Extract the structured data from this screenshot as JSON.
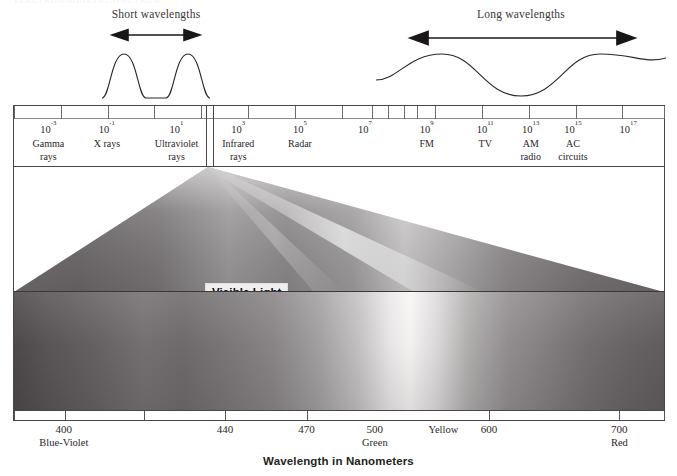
{
  "top_caption": "ELECTROMAGNETIC SPECTRUM",
  "waves": {
    "short": {
      "label": "Short wavelengths"
    },
    "long": {
      "label": "Long wavelengths"
    }
  },
  "scale": {
    "ticks_pct": [
      0,
      7.2,
      14.4,
      21.6,
      28.8,
      36.0,
      43.2,
      50.4,
      55.0,
      57.6,
      60.0,
      62.0,
      64.8,
      72.0,
      79.2,
      86.4,
      93.6,
      100
    ],
    "visible_slot": {
      "start_pct": 29.6,
      "end_pct": 30.6
    },
    "labels": [
      {
        "pos_pct": 5.3,
        "exponent": "-3",
        "name": [
          "Gamma",
          "rays"
        ]
      },
      {
        "pos_pct": 14.3,
        "exponent": "-1",
        "name": [
          "X rays"
        ]
      },
      {
        "pos_pct": 25.0,
        "exponent": "1",
        "name": [
          "Ultraviolet",
          "rays"
        ]
      },
      {
        "pos_pct": 34.5,
        "exponent": "3",
        "name": [
          "Infrared",
          "rays"
        ]
      },
      {
        "pos_pct": 44.0,
        "exponent": "5",
        "name": [
          "Radar"
        ]
      },
      {
        "pos_pct": 54.0,
        "exponent": "7",
        "name": []
      },
      {
        "pos_pct": 63.5,
        "exponent": "9",
        "name": [
          "FM"
        ]
      },
      {
        "pos_pct": 72.5,
        "exponent": "11",
        "name": [
          "TV"
        ]
      },
      {
        "pos_pct": 79.5,
        "exponent": "13",
        "name": [
          "AM",
          "radio"
        ]
      },
      {
        "pos_pct": 86.0,
        "exponent": "15",
        "name": [
          "AC",
          "circuits"
        ]
      },
      {
        "pos_pct": 94.5,
        "exponent": "17",
        "name": []
      }
    ]
  },
  "visible_light_label": "Visible Light",
  "nm_ruler": {
    "ticks_pct": [
      0,
      7.8,
      20.0,
      32.5,
      45.0,
      73.0,
      93.0,
      100
    ],
    "labels": [
      {
        "pos_pct": 7.8,
        "value": "400",
        "color_name": "Blue-Violet"
      },
      {
        "pos_pct": 32.5,
        "value": "440",
        "color_name": ""
      },
      {
        "pos_pct": 45.0,
        "value": "470",
        "color_name": ""
      },
      {
        "pos_pct": 55.5,
        "value": "500",
        "color_name": "Green"
      },
      {
        "pos_pct": 66.0,
        "value": "",
        "color_name": "Yellow"
      },
      {
        "pos_pct": 73.0,
        "value": "600",
        "color_name": ""
      },
      {
        "pos_pct": 93.0,
        "value": "700",
        "color_name": "Red"
      }
    ]
  },
  "axis_title": "Wavelength in Nanometers",
  "chart_data": {
    "type": "heatmap",
    "title": "Wavelength in Nanometers",
    "xlabel": "Wavelength in Nanometers",
    "ylabel": "",
    "grid": false,
    "legend_position": "none",
    "em_spectrum_scale_unit": "nanometers",
    "em_bands": [
      {
        "name": "Gamma rays",
        "wavelength_nm_label": "10^-3"
      },
      {
        "name": "X rays",
        "wavelength_nm_label": "10^-1"
      },
      {
        "name": "Ultraviolet rays",
        "wavelength_nm_label": "10^1"
      },
      {
        "name": "Visible Light",
        "wavelength_nm_label": "400-700"
      },
      {
        "name": "Infrared rays",
        "wavelength_nm_label": "10^3"
      },
      {
        "name": "Radar",
        "wavelength_nm_label": "10^5"
      },
      {
        "name": "FM",
        "wavelength_nm_label": "10^9"
      },
      {
        "name": "TV",
        "wavelength_nm_label": "10^11"
      },
      {
        "name": "AM radio",
        "wavelength_nm_label": "10^13"
      },
      {
        "name": "AC circuits",
        "wavelength_nm_label": "10^15"
      }
    ],
    "visible_ticks_nm": [
      400,
      440,
      470,
      500,
      600,
      700
    ],
    "visible_color_names": [
      "Blue-Violet",
      "Green",
      "Yellow",
      "Red"
    ],
    "xlim_nm": [
      390,
      710
    ]
  }
}
